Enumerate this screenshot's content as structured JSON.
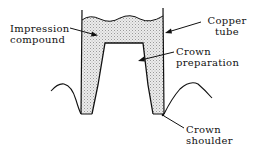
{
  "diagram": {
    "labels": {
      "impression_compound": [
        "Impression",
        "compound"
      ],
      "copper_tube": [
        "Copper",
        "tube"
      ],
      "crown_preparation": [
        "Crown",
        "preparation"
      ],
      "crown_shoulder": [
        "Crown",
        "shoulder"
      ]
    },
    "colors": {
      "line": "#111111",
      "compound_fill": "#d8d8d8",
      "background": "#ffffff"
    }
  }
}
